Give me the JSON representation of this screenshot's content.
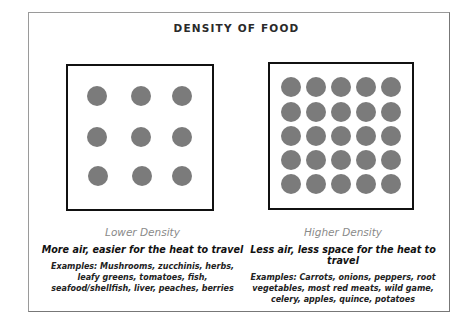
{
  "title": "DENSITY OF FOOD",
  "panels": [
    {
      "label": "Lower Density",
      "subtitle": "More air, easier for the heat to travel",
      "examples": "Examples: Mushrooms, zucchinis, herbs, leafy greens, tomatoes, fish, seafood/shellfish, liver, peaches, berries",
      "grid": {
        "rows": 3,
        "cols": 3
      }
    },
    {
      "label": "Higher Density",
      "subtitle": "Less air, less space for the heat to travel",
      "examples": "Examples: Carrots, onions, peppers, root vegetables, most red meats, wild game, celery, apples, quince, potatoes",
      "grid": {
        "rows": 5,
        "cols": 5
      }
    }
  ],
  "colors": {
    "dot": "#7b7b7b",
    "box_border": "#111111",
    "label": "#8a8a8a"
  }
}
